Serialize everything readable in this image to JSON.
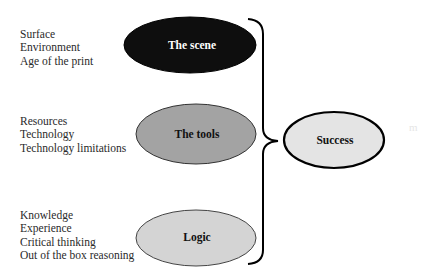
{
  "groups": [
    {
      "name": "The scene",
      "factors": [
        "Surface",
        "Environment",
        "Age of the print"
      ],
      "fill": "#0e0e0e",
      "label_color": "#ffffff"
    },
    {
      "name": "The tools",
      "factors": [
        "Resources",
        "Technology",
        "Technology limitations"
      ],
      "fill": "#a3a3a3",
      "label_color": "#111111"
    },
    {
      "name": "Logic",
      "factors": [
        "Knowledge",
        "Experience",
        "Critical thinking",
        "Out of the box reasoning"
      ],
      "fill": "#d4d4d4",
      "label_color": "#111111"
    }
  ],
  "outcome": {
    "name": "Success",
    "fill": "#e4e4e4"
  },
  "artifact_text": "m"
}
